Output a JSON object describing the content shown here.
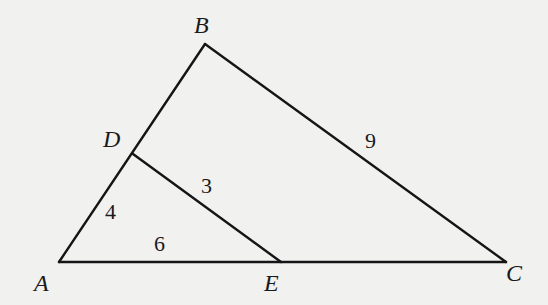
{
  "diagram": {
    "type": "geometry-triangle",
    "vertices": {
      "A": {
        "label": "A",
        "x": 59,
        "y": 262
      },
      "B": {
        "label": "B",
        "x": 205,
        "y": 44
      },
      "C": {
        "label": "C",
        "x": 506,
        "y": 262
      },
      "D": {
        "label": "D",
        "x": 133,
        "y": 154
      },
      "E": {
        "label": "E",
        "x": 281,
        "y": 262
      }
    },
    "segments": [
      {
        "name": "AB",
        "from": "A",
        "to": "B"
      },
      {
        "name": "BC",
        "from": "B",
        "to": "C"
      },
      {
        "name": "AC",
        "from": "A",
        "to": "C"
      },
      {
        "name": "DE",
        "from": "D",
        "to": "E"
      }
    ],
    "lengths": {
      "AD": "4",
      "AE": "6",
      "DE": "3",
      "BC": "9"
    },
    "colors": {
      "background": "#f1f1f0",
      "stroke": "#151515",
      "text": "#1a1a1a"
    }
  }
}
